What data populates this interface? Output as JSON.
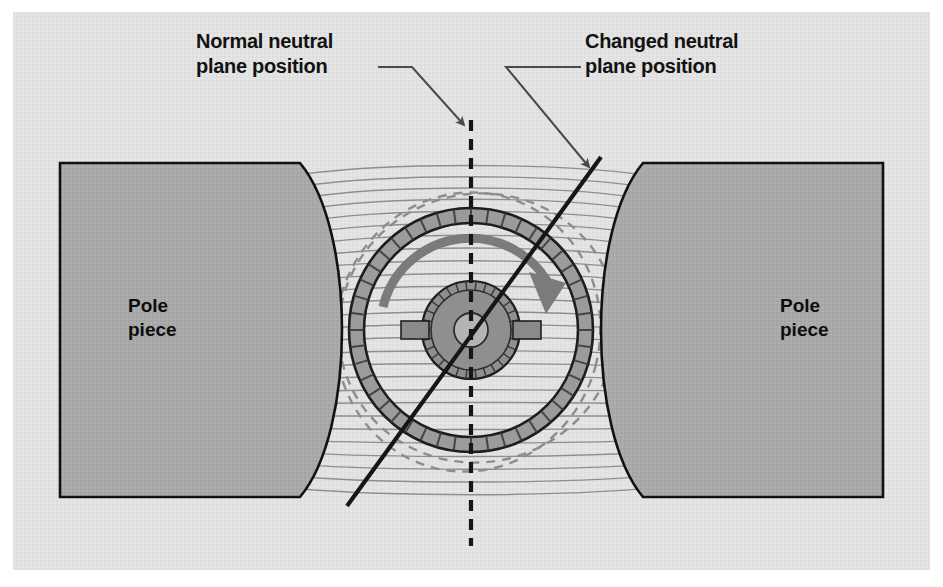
{
  "figure": {
    "background_color": "#ffffff",
    "panel_color": "#e2e2e2",
    "panel": {
      "x": 13,
      "y": 12,
      "width": 917,
      "height": 558
    }
  },
  "labels": {
    "normal_neutral": {
      "line1": "Normal neutral",
      "line2": "plane position",
      "x": 196,
      "y": 44,
      "color": "#121212"
    },
    "changed_neutral": {
      "line1": "Changed neutral",
      "line2": "plane position",
      "x": 585,
      "y": 44,
      "color": "#121212"
    },
    "pole_left": {
      "line1": "Pole",
      "line2": "piece",
      "x": 128,
      "y": 318,
      "color": "#0d0d0d"
    },
    "pole_right": {
      "line1": "Pole",
      "line2": "piece",
      "x": 780,
      "y": 318,
      "color": "#0d0d0d"
    }
  },
  "leaders": {
    "normal": {
      "name": "leader-normal-neutral",
      "points": "378,67 412,67 466,126",
      "arrow_tip": {
        "x": 469,
        "y": 131
      },
      "color": "#4a4a4a"
    },
    "changed": {
      "name": "leader-changed-neutral",
      "points": "581,67 506,67 590,168",
      "arrow_tip": {
        "x": 594,
        "y": 173
      },
      "color": "#4a4a4a"
    }
  },
  "pole_pieces": {
    "fill": "#a8a8a8",
    "stroke": "#111111",
    "stroke_width": 2.5,
    "left": {
      "x": 60,
      "y": 163,
      "width": 240,
      "height": 330
    },
    "right": {
      "x": 643,
      "y": 163,
      "width": 240,
      "height": 330
    }
  },
  "neutral_planes": {
    "normal": {
      "name": "normal-neutral-plane-line",
      "style": "dashed",
      "x1": 471,
      "y1": 120,
      "x2": 471,
      "y2": 546,
      "color": "#161616",
      "width": 4,
      "dash": "11,8"
    },
    "changed": {
      "name": "changed-neutral-plane-line",
      "style": "solid",
      "x1": 601,
      "y1": 157,
      "x2": 347,
      "y2": 506,
      "color": "#161616",
      "width": 4,
      "angle_deg": 54
    }
  },
  "armature": {
    "center": {
      "x": 471,
      "y": 330
    },
    "outer_ring_radius": 122,
    "outer_ring_thickness": 15,
    "ring_fill": "#9b9b9b",
    "ring_stroke": "#1d1d1d",
    "slot_count": 44,
    "core_radius": 47,
    "core_fill": "#8f8f8f",
    "commutator_radius": 40,
    "commutator_segments": 30,
    "hub_radius": 17,
    "hub_fill": "#b4b4b4",
    "brush_color": "#8a8a8a",
    "brush_left": {
      "x": 403,
      "y": 322,
      "width": 26,
      "height": 17
    },
    "brush_right": {
      "x": 513,
      "y": 322,
      "width": 26,
      "height": 17
    }
  },
  "distortion_circles": {
    "color": "#8d8d8d",
    "dash": "9,7",
    "ellipses": [
      {
        "cx": 478,
        "cy": 328,
        "rx": 140,
        "ry": 134,
        "rot": -18
      },
      {
        "cx": 468,
        "cy": 332,
        "rx": 132,
        "ry": 140,
        "rot": 14
      }
    ]
  },
  "rotation_arrow": {
    "name": "rotation-direction-arrow",
    "color": "#7b7b7b",
    "width": 9,
    "radius": 90,
    "start_angle_deg": 193,
    "end_angle_deg": 18,
    "arrow_tip": {
      "x": 556,
      "y": 300
    }
  },
  "field_lines": {
    "count": 26,
    "color": "#8a8a8a",
    "width": 1.3,
    "left_edge_x": 299,
    "right_edge_x": 644,
    "top_y": 168,
    "bottom_y": 492,
    "description": "Horizontal magnetic flux lines bowed around the armature"
  }
}
